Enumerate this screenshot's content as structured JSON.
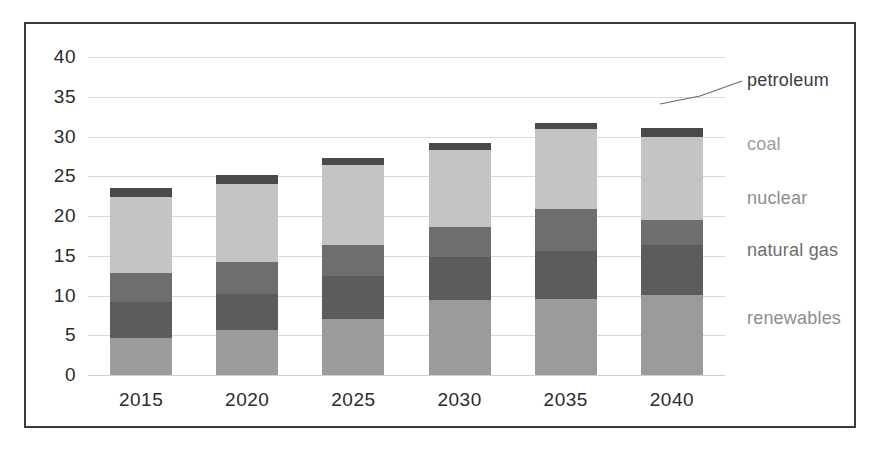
{
  "chart_data": {
    "type": "bar",
    "subtype": "stacked-bar",
    "title": "",
    "xlabel": "",
    "ylabel": "",
    "categories": [
      "2015",
      "2020",
      "2025",
      "2030",
      "2035",
      "2040"
    ],
    "series": [
      {
        "name": "renewables",
        "values": [
          4.7,
          5.7,
          7.1,
          9.4,
          9.6,
          10.1
        ],
        "color": "#9b9b9b"
      },
      {
        "name": "natural gas",
        "values": [
          4.5,
          4.5,
          5.3,
          5.4,
          6.0,
          6.3
        ],
        "color": "#5c5c5c"
      },
      {
        "name": "nuclear",
        "values": [
          3.6,
          4.0,
          4.0,
          3.8,
          5.3,
          3.1
        ],
        "color": "#6e6e6e"
      },
      {
        "name": "coal",
        "values": [
          9.6,
          9.8,
          10.0,
          9.7,
          10.0,
          10.4
        ],
        "color": "#c4c4c4"
      },
      {
        "name": "petroleum",
        "values": [
          1.1,
          1.2,
          0.9,
          0.9,
          0.8,
          1.2
        ],
        "color": "#4a4a4a"
      }
    ],
    "totals": [
      23.5,
      25.2,
      27.3,
      29.2,
      31.7,
      34.2
    ],
    "yticks": [
      0,
      5,
      10,
      15,
      20,
      25,
      30,
      35,
      40
    ],
    "ylim": [
      0,
      40
    ],
    "grid": true,
    "legend_position": "right-inline-labels",
    "annotations": [
      {
        "text": "petroleum",
        "target_series": "petroleum",
        "leader_line": true
      }
    ]
  },
  "series_labels": {
    "petroleum": "petroleum",
    "coal": "coal",
    "nuclear": "nuclear",
    "natural_gas": "natural gas",
    "renewables": "renewables"
  },
  "colors": {
    "petroleum": "#4a4a4a",
    "coal": "#c4c4c4",
    "nuclear": "#6e6e6e",
    "natural_gas": "#5c5c5c",
    "renewables": "#9b9b9b",
    "label_text": "#8d8d8d",
    "petroleum_label_text": "#3b3b3b",
    "axis_text": "#2b2b2b",
    "gridline": "#d8d8d8",
    "frame_border": "#3a3a3a",
    "background": "#ffffff"
  }
}
